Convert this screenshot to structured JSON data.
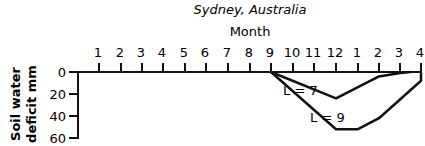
{
  "chart_data": {
    "type": "line",
    "title": "Sydney, Australia",
    "xlabel": "Month",
    "ylabel": "Soil water deficit mm",
    "x_axis_position": "top",
    "y_inverted": true,
    "categories": [
      "1",
      "2",
      "3",
      "4",
      "5",
      "6",
      "7",
      "8",
      "9",
      "10",
      "11",
      "12",
      "1",
      "2",
      "3",
      "4"
    ],
    "yticks": [
      0,
      20,
      40,
      60
    ],
    "ylim": [
      0,
      60
    ],
    "grid": false,
    "series": [
      {
        "name": "L = 7",
        "points": [
          [
            9,
            0
          ],
          [
            12,
            24
          ],
          [
            2,
            4
          ],
          [
            3,
            1
          ],
          [
            3.5,
            0
          ]
        ]
      },
      {
        "name": "L = 9",
        "points": [
          [
            9,
            0
          ],
          [
            12,
            52
          ],
          [
            1,
            52
          ],
          [
            2,
            42
          ],
          [
            4,
            8
          ],
          [
            4.9,
            0
          ]
        ]
      }
    ],
    "annotations": [
      "L = 7",
      "L = 9"
    ]
  }
}
